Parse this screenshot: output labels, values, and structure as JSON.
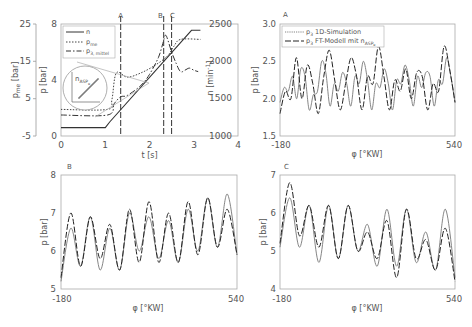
{
  "chart_data": [
    {
      "id": "overview",
      "type": "line",
      "xlabel": "t [s]",
      "ylabel_left_outer": "p_me [bar]",
      "ylabel_left_inner": "p [bar]",
      "ylabel_right": "n [min^-1]",
      "xlim": [
        0,
        4
      ],
      "xticks": [
        "0",
        "1",
        "2",
        "3",
        "4"
      ],
      "ylim_p": [
        0,
        8
      ],
      "yticks_p": [
        "0",
        "4",
        "8"
      ],
      "ylim_pme": [
        -5,
        25
      ],
      "yticks_pme": [
        "-5",
        "5",
        "15",
        "25"
      ],
      "ylim_n": [
        1000,
        2500
      ],
      "yticks_n": [
        "1000",
        "1500",
        "2000",
        "2500"
      ],
      "markers": [
        {
          "label": "A",
          "t": 1.35
        },
        {
          "label": "B",
          "t": 2.32
        },
        {
          "label": "C",
          "t": 2.5
        }
      ],
      "legend": [
        "n",
        "p_me",
        "p_3,mittel"
      ],
      "inset_label": "n_ASP_e",
      "series": [
        {
          "name": "n",
          "style": "solid",
          "t": [
            0,
            1.0,
            1.1,
            2.95,
            3.15
          ],
          "p": [
            0.6,
            0.6,
            1.0,
            7.55,
            7.55
          ]
        },
        {
          "name": "p_me",
          "style": "dotted",
          "t": [
            0,
            1.05,
            1.15,
            1.25,
            1.5,
            1.8,
            2.1,
            2.4,
            2.55,
            2.7,
            3.15
          ],
          "p": [
            1.9,
            1.9,
            2.6,
            4.5,
            4.2,
            4.5,
            5.0,
            5.7,
            6.4,
            6.9,
            6.9
          ]
        },
        {
          "name": "p_3,mittel",
          "style": "dashdot",
          "t": [
            0,
            1.05,
            1.2,
            1.35,
            1.5,
            1.8,
            2.0,
            2.2,
            2.3,
            2.36,
            2.42,
            2.5,
            2.6,
            2.7,
            2.8,
            2.9,
            3.0,
            3.1
          ],
          "p": [
            1.5,
            1.5,
            2.3,
            2.8,
            2.9,
            3.6,
            4.4,
            5.6,
            6.6,
            7.2,
            6.8,
            6.0,
            5.2,
            4.6,
            4.7,
            4.85,
            4.7,
            4.6
          ]
        }
      ]
    },
    {
      "id": "A",
      "type": "line",
      "panel_label": "A",
      "xlabel": "φ [°KW]",
      "ylabel": "p [bar]",
      "xlim": [
        -180,
        540
      ],
      "xticks": [
        "-180",
        "540"
      ],
      "ylim": [
        1.5,
        3.0
      ],
      "yticks": [
        "1.5",
        "2.0",
        "2.5",
        "3.0"
      ],
      "legend": [
        "p3 1D-Simulation",
        "p3 FT-Modell mit n_ASP_e"
      ],
      "series": [
        {
          "name": "p3 1D-Simulation",
          "style": "solid",
          "x": [
            -180,
            -165,
            -150,
            -135,
            -120,
            -105,
            -90,
            -75,
            -60,
            -45,
            -30,
            -15,
            0,
            15,
            30,
            45,
            60,
            75,
            90,
            105,
            120,
            135,
            150,
            165,
            180,
            195,
            210,
            225,
            240,
            255,
            270,
            285,
            300,
            315,
            330,
            345,
            360,
            375,
            390,
            405,
            420,
            435,
            450,
            465,
            480,
            495,
            510,
            525,
            540
          ],
          "y": [
            1.95,
            2.15,
            2.1,
            2.3,
            2.0,
            2.4,
            2.3,
            1.85,
            2.05,
            2.1,
            2.5,
            2.35,
            1.9,
            2.2,
            2.1,
            2.35,
            2.2,
            1.9,
            2.3,
            2.2,
            2.5,
            2.25,
            1.85,
            2.2,
            2.15,
            2.4,
            2.2,
            1.85,
            2.25,
            2.2,
            2.45,
            2.25,
            1.9,
            2.3,
            2.15,
            2.35,
            2.3,
            1.9,
            2.25,
            2.2,
            2.55,
            2.3,
            1.95
          ]
        },
        {
          "name": "p3 FT-Modell mit n_ASP_e",
          "style": "dashed",
          "x": [
            -180,
            -165,
            -150,
            -135,
            -120,
            -105,
            -90,
            -75,
            -60,
            -45,
            -30,
            -15,
            0,
            15,
            30,
            45,
            60,
            75,
            90,
            105,
            120,
            135,
            150,
            165,
            180,
            195,
            210,
            225,
            240,
            255,
            270,
            285,
            300,
            315,
            330,
            345,
            360,
            375,
            390,
            405,
            420,
            435,
            450,
            465,
            480,
            495,
            510,
            525,
            540
          ],
          "y": [
            1.8,
            2.1,
            2.0,
            2.55,
            2.0,
            2.45,
            2.2,
            1.8,
            2.3,
            2.65,
            2.25,
            1.85,
            2.2,
            2.55,
            2.3,
            1.85,
            2.3,
            2.2,
            2.7,
            2.3,
            1.85,
            2.25,
            2.1,
            2.4,
            2.0,
            2.35,
            2.3,
            1.85,
            2.2,
            2.1,
            2.7,
            2.4,
            1.95
          ]
        }
      ]
    },
    {
      "id": "B",
      "type": "line",
      "panel_label": "B",
      "xlabel": "φ [°KW]",
      "ylabel": "p [bar]",
      "xlim": [
        -180,
        540
      ],
      "xticks": [
        "-180",
        "540"
      ],
      "ylim": [
        5,
        8
      ],
      "yticks": [
        "5",
        "6",
        "7",
        "8"
      ],
      "series": [
        {
          "name": "p3 1D-Simulation",
          "style": "solid",
          "x": [
            -180,
            -160,
            -140,
            -120,
            -100,
            -80,
            -60,
            -40,
            -20,
            0,
            20,
            40,
            60,
            80,
            100,
            120,
            140,
            160,
            180,
            200,
            220,
            240,
            260,
            280,
            300,
            320,
            340,
            360,
            380,
            400,
            420,
            440,
            460,
            480,
            500,
            520,
            540
          ],
          "y": [
            5.2,
            6.6,
            5.6,
            6.9,
            5.5,
            6.6,
            5.5,
            7.0,
            6.0,
            6.9,
            5.8,
            6.8,
            5.7,
            7.1,
            6.0,
            7.4,
            6.1,
            7.5,
            5.9
          ]
        },
        {
          "name": "p3 FT-Modell mit n_ASP_e",
          "style": "dashed",
          "x": [
            -180,
            -160,
            -140,
            -120,
            -100,
            -80,
            -60,
            -40,
            -20,
            0,
            20,
            40,
            60,
            80,
            100,
            120,
            140,
            160,
            180,
            200,
            220,
            240,
            260,
            280,
            300,
            320,
            340,
            360,
            380,
            400,
            420,
            440,
            460,
            480,
            500,
            520,
            540
          ],
          "y": [
            5.3,
            7.0,
            5.6,
            6.9,
            5.8,
            6.7,
            5.5,
            7.1,
            5.7,
            7.3,
            5.7,
            7.0,
            5.7,
            7.3,
            5.9,
            7.4,
            6.1,
            7.1,
            5.9
          ]
        }
      ]
    },
    {
      "id": "C",
      "type": "line",
      "panel_label": "C",
      "xlabel": "φ [°KW]",
      "ylabel": "p [bar]",
      "xlim": [
        -180,
        540
      ],
      "xticks": [
        "-180",
        "540"
      ],
      "ylim": [
        4,
        7
      ],
      "yticks": [
        "4",
        "5",
        "6",
        "7"
      ],
      "series": [
        {
          "name": "p3 1D-Simulation",
          "style": "solid",
          "x": [],
          "y": [
            5.1,
            6.4,
            5.1,
            6.2,
            4.7,
            6.2,
            4.8,
            6.2,
            5.0,
            5.7,
            4.6,
            6.1,
            4.6,
            6.1,
            4.7,
            5.5,
            4.5,
            6.1,
            4.3
          ]
        },
        {
          "name": "p3 FT-Modell mit n_ASP_e",
          "style": "dashed",
          "x": [],
          "y": [
            5.2,
            6.8,
            5.4,
            6.2,
            5.1,
            6.2,
            4.8,
            6.2,
            5.0,
            5.5,
            4.8,
            5.8,
            4.3,
            6.1,
            4.8,
            5.3,
            4.5,
            5.6,
            4.2
          ]
        }
      ]
    }
  ],
  "overview": {
    "xlabel": "t [s]",
    "ylabel_pme": "p",
    "ylabel_pme_sub": "me",
    "ylabel_pme_unit": " [bar]",
    "ylabel_p": "p [bar]",
    "ylabel_n": "n [min",
    "ylabel_n_sup": "-1",
    "ylabel_n_end": "]",
    "xticks": [
      "0",
      "1",
      "2",
      "3",
      "4"
    ],
    "pticks": [
      "0",
      "4",
      "8"
    ],
    "pmeticks": [
      "-5",
      "5",
      "15",
      "25"
    ],
    "nticks": [
      "1000",
      "1500",
      "2000",
      "2500"
    ],
    "marker_a": "A",
    "marker_b": "B",
    "marker_c": "C",
    "legend_n": "n",
    "legend_pme": "p",
    "legend_pme_sub": "me",
    "legend_p3": "p",
    "legend_p3_sub": "3, mittel",
    "inset_n": "n",
    "inset_sub": "ASP",
    "inset_sub2": "e"
  },
  "panelA": {
    "label": "A",
    "ylabel": "p [bar]",
    "xlabel": "φ [°KW]",
    "xmin": "-180",
    "xmax": "540",
    "yticks": [
      "1.5",
      "2.0",
      "2.5",
      "3.0"
    ],
    "legend1_p": "p",
    "legend1_sub": "3",
    "legend1_text": " 1D-Simulation",
    "legend2_p": "p",
    "legend2_sub": "3",
    "legend2_text": " FT-Modell mit ",
    "legend2_n": "n",
    "legend2_nsub": "ASP",
    "legend2_nsub2": "e"
  },
  "panelB": {
    "label": "B",
    "ylabel": "p [bar]",
    "xlabel": "φ [°KW]",
    "xmin": "-180",
    "xmax": "540",
    "yticks": [
      "5",
      "6",
      "7",
      "8"
    ]
  },
  "panelC": {
    "label": "C",
    "ylabel": "p [bar]",
    "xlabel": "φ [°KW]",
    "xmin": "-180",
    "xmax": "540",
    "yticks": [
      "4",
      "5",
      "6",
      "7"
    ]
  }
}
